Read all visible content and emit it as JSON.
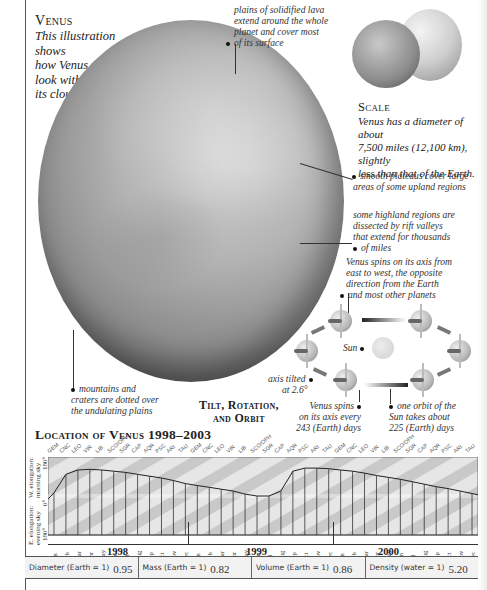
{
  "header": {
    "title": "Venus",
    "caption": [
      "This illustration shows",
      "how Venus would",
      "look without",
      "its clouds."
    ]
  },
  "annotations": {
    "lava": [
      "plains of solidified lava",
      "extend around the whole",
      "planet and cover most",
      "of its surface"
    ],
    "plateaus": [
      "smooth plateaus cover large",
      "areas of some upland regions"
    ],
    "rift": [
      "some highland regions are",
      "dissected by rift valleys",
      "that extend for thousands",
      "of miles"
    ],
    "mountains": [
      "mountains and",
      "craters are dotted over",
      "the undulating plains"
    ]
  },
  "scale": {
    "title": "Scale",
    "text": [
      "Venus has a diameter of about",
      "7,500 miles (12,100 km), slightly",
      "less than that of the Earth."
    ]
  },
  "orbit": {
    "spin_note": [
      "Venus spins on its axis from",
      "east to west, the opposite",
      "direction from the Earth",
      "and most other planets"
    ],
    "sun_label": "Sun",
    "axis_label": [
      "axis tilted",
      "at 2.6°"
    ],
    "title": [
      "Tilt, Rotation,",
      "and Orbit"
    ],
    "rotation_note": [
      "Venus spins",
      "on its axis every",
      "243 (Earth) days"
    ],
    "orbit_note": [
      "one orbit of the",
      "Sun takes about",
      "225 (Earth) days"
    ]
  },
  "location": {
    "title": "Location of Venus 1998–2003",
    "y_axis": {
      "top_label": [
        "W. elongation:",
        "morning sky"
      ],
      "bottom_label": [
        "E. elongation:",
        "evening sky"
      ],
      "ticks": [
        "180°",
        "0°",
        "180°"
      ]
    },
    "zodiac": [
      "GEM",
      "CNC",
      "LEO",
      "VIR",
      "LIB",
      "SCO/OPH",
      "SGR",
      "CAP",
      "AQR",
      "PSC",
      "ARI",
      "TAU",
      "GEM",
      "CNC",
      "LEO",
      "VIR",
      "LIB",
      "SCO/OPH",
      "SGR",
      "CAP",
      "AQR",
      "PSC",
      "ARI",
      "TAU",
      "GEM",
      "CNC",
      "LEO",
      "VIR",
      "LIB",
      "SCO/OPH",
      "SGR",
      "CAP",
      "AQR",
      "PSC",
      "ARI",
      "TAU"
    ],
    "months": [
      "Jan",
      "Feb",
      "Mar",
      "Apr",
      "May",
      "Jun",
      "Jul",
      "Aug",
      "Sep",
      "Oct",
      "Nov",
      "Dec",
      "Jan",
      "Feb",
      "Mar",
      "Apr",
      "May",
      "Jun",
      "Jul",
      "Aug",
      "Sep",
      "Oct",
      "Nov",
      "Dec",
      "Jan",
      "Feb",
      "Mar",
      "Apr",
      "May",
      "Jun",
      "Jul",
      "Aug",
      "Sep",
      "Oct",
      "Nov",
      "Dec"
    ],
    "years": [
      "1998",
      "1999",
      "2000"
    ]
  },
  "stats": [
    {
      "label": "Diameter (Earth = 1)",
      "value": "0.95"
    },
    {
      "label": "Mass (Earth = 1)",
      "value": "0.82"
    },
    {
      "label": "Volume (Earth = 1)",
      "value": "0.86"
    },
    {
      "label": "Density (water = 1)",
      "value": "5.20"
    }
  ],
  "chart_data": {
    "type": "line",
    "title": "Location of Venus 1998–2003",
    "xlabel": "Month",
    "ylabel": "Elongation (W. morning sky positive / E. evening sky negative)",
    "ylim": [
      -180,
      180
    ],
    "categories": [
      "Jan 1998",
      "Feb 1998",
      "Mar 1998",
      "Apr 1998",
      "May 1998",
      "Jun 1998",
      "Jul 1998",
      "Aug 1998",
      "Sep 1998",
      "Oct 1998",
      "Nov 1998",
      "Dec 1998",
      "Jan 1999",
      "Feb 1999",
      "Mar 1999",
      "Apr 1999",
      "May 1999",
      "Jun 1999",
      "Jul 1999",
      "Aug 1999",
      "Sep 1999",
      "Oct 1999",
      "Nov 1999",
      "Dec 1999",
      "Jan 2000",
      "Feb 2000",
      "Mar 2000",
      "Apr 2000",
      "May 2000",
      "Jun 2000",
      "Jul 2000",
      "Aug 2000",
      "Sep 2000",
      "Oct 2000",
      "Nov 2000",
      "Dec 2000"
    ],
    "series": [
      {
        "name": "Venus position",
        "values": [
          5,
          35,
          42,
          43,
          42,
          40,
          38,
          35,
          32,
          29,
          25,
          20,
          17,
          14,
          11,
          8,
          3,
          0,
          0,
          8,
          40,
          45,
          45,
          44,
          42,
          40,
          37,
          33,
          30,
          27,
          23,
          19,
          15,
          12,
          8,
          4
        ]
      }
    ],
    "grid": false,
    "legend": null
  }
}
